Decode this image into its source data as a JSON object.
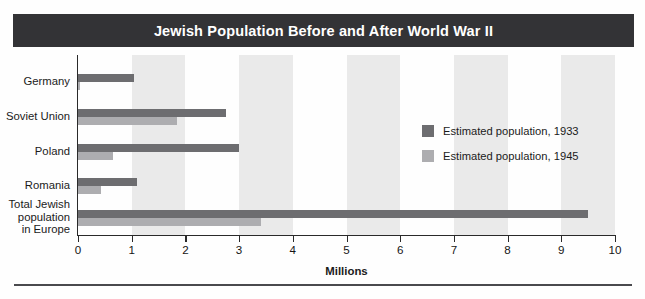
{
  "title": "Jewish Population Before and After World War II",
  "colors": {
    "title_band": "#333336",
    "title_text": "#ffffff",
    "series_1933": "#6d6d70",
    "series_1945": "#adadb0",
    "band": "#eaeaea",
    "axis": "#2a2a2a",
    "rule": "#4a4a4e"
  },
  "legend": {
    "position": "top-right",
    "items": [
      {
        "label": "Estimated population, 1933",
        "swatch": "#6d6d70"
      },
      {
        "label": "Estimated population, 1945",
        "swatch": "#adadb0"
      }
    ]
  },
  "axis": {
    "title": "Millions",
    "ticks": [
      "0",
      "1",
      "2",
      "3",
      "4",
      "5",
      "6",
      "7",
      "8",
      "9",
      "10"
    ]
  },
  "categories": [
    {
      "lines": [
        "Germany"
      ]
    },
    {
      "lines": [
        "Soviet Union"
      ]
    },
    {
      "lines": [
        "Poland"
      ]
    },
    {
      "lines": [
        "Romania"
      ]
    },
    {
      "lines": [
        "Total Jewish",
        "population",
        "in Europe"
      ]
    }
  ],
  "chart_data": {
    "type": "bar",
    "orientation": "horizontal",
    "title": "Jewish Population Before and After World War II",
    "xlabel": "Millions",
    "ylabel": "",
    "xlim": [
      0,
      10
    ],
    "xticks": [
      0,
      1,
      2,
      3,
      4,
      5,
      6,
      7,
      8,
      9,
      10
    ],
    "grid": false,
    "banded_background": true,
    "legend_position": "top-right",
    "categories": [
      "Germany",
      "Soviet Union",
      "Poland",
      "Romania",
      "Total Jewish population in Europe"
    ],
    "series": [
      {
        "name": "Estimated population, 1933",
        "color": "#6d6d70",
        "values": [
          1.05,
          2.75,
          3.0,
          1.1,
          9.5
        ]
      },
      {
        "name": "Estimated population, 1945",
        "color": "#adadb0",
        "values": [
          0.03,
          1.85,
          0.65,
          0.43,
          3.4
        ]
      }
    ],
    "units": "millions of people"
  }
}
